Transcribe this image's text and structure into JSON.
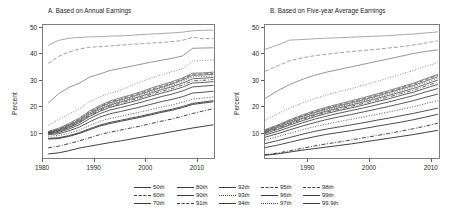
{
  "figure": {
    "panels": [
      {
        "id": "A",
        "title": "A. Based on Annual Earnings",
        "ylabel": "Percent",
        "yticks": [
          "10",
          "20",
          "30",
          "40",
          "50"
        ],
        "xticks": [
          "1980",
          "1990",
          "2000",
          "2010"
        ]
      },
      {
        "id": "B",
        "title": "B. Based on Five-year Average Earnings",
        "ylabel": "Percent",
        "yticks": [
          "10",
          "20",
          "30",
          "40",
          "50"
        ],
        "xticks": [
          "1990",
          "2000",
          "2010"
        ]
      }
    ],
    "legend": {
      "columns": [
        {
          "items": [
            {
              "label": "50th",
              "style": "solid"
            },
            {
              "label": "60th",
              "style": "dash"
            },
            {
              "label": "70th",
              "style": "solid"
            }
          ]
        },
        {
          "items": [
            {
              "label": "80th",
              "style": "solid"
            },
            {
              "label": "90th",
              "style": "solid"
            },
            {
              "label": "91th",
              "style": "dashdot"
            }
          ]
        },
        {
          "items": [
            {
              "label": "92th",
              "style": "solid"
            },
            {
              "label": "93th",
              "style": "dot"
            },
            {
              "label": "94th",
              "style": "solid"
            }
          ]
        },
        {
          "items": [
            {
              "label": "95th",
              "style": "dash"
            },
            {
              "label": "96th",
              "style": "solid"
            },
            {
              "label": "97th",
              "style": "dot"
            }
          ]
        },
        {
          "items": [
            {
              "label": "98th",
              "style": "dash"
            },
            {
              "label": "99th",
              "style": "solid"
            },
            {
              "label": "99.9th",
              "style": "solid"
            }
          ]
        }
      ]
    }
  },
  "chart_data": {
    "type": "line",
    "xlabel": "",
    "ylabel": "Percent",
    "ylim": [
      0,
      51
    ],
    "grid": false,
    "legend_position": "bottom",
    "panels": [
      {
        "id": "A",
        "title": "A. Based on Annual Earnings",
        "xlim": [
          1980,
          2013.5
        ],
        "x": [
          1981,
          1983,
          1985,
          1987,
          1989,
          1991,
          1993,
          1995,
          1997,
          1999,
          2001,
          2003,
          2005,
          2007,
          2009,
          2011,
          2013
        ],
        "series": [
          {
            "name": "99.9th",
            "style": "solid",
            "values": [
              43.3,
              45.2,
              46.0,
              46.3,
              46.5,
              46.6,
              46.8,
              46.9,
              47.1,
              47.4,
              47.6,
              47.8,
              48.0,
              48.3,
              48.8,
              49.0,
              49.1
            ]
          },
          {
            "name": "99th",
            "style": "dash",
            "values": [
              36.5,
              39.1,
              40.8,
              41.9,
              42.6,
              42.8,
              43.1,
              43.4,
              43.7,
              43.9,
              44.2,
              44.4,
              44.7,
              45.2,
              46.4,
              45.8,
              45.9
            ]
          },
          {
            "name": "98th",
            "style": "solid",
            "values": [
              21.5,
              25.0,
              27.4,
              29.0,
              31.3,
              32.5,
              33.8,
              34.6,
              35.4,
              36.2,
              37.0,
              37.7,
              38.4,
              39.3,
              42.2,
              42.3,
              42.4
            ]
          },
          {
            "name": "97th",
            "style": "dot",
            "values": [
              13.0,
              15.3,
              17.3,
              19.2,
              22.0,
              23.8,
              25.3,
              26.4,
              28.0,
              29.6,
              31.0,
              32.2,
              33.4,
              34.5,
              37.4,
              37.6,
              37.8
            ]
          },
          {
            "name": "96th",
            "style": "solid",
            "values": [
              10.8,
              12.0,
              13.8,
              15.8,
              18.5,
              20.6,
              22.3,
              23.5,
              24.6,
              25.8,
              27.2,
              28.4,
              29.6,
              31.0,
              32.8,
              32.9,
              33.2
            ]
          },
          {
            "name": "95th",
            "style": "dash",
            "values": [
              10.6,
              11.7,
              13.4,
              15.4,
              18.1,
              20.2,
              21.9,
              23.0,
              24.2,
              25.4,
              26.7,
              27.9,
              29.1,
              30.6,
              32.4,
              32.5,
              32.8
            ]
          },
          {
            "name": "94th",
            "style": "solid",
            "values": [
              10.5,
              11.5,
              13.2,
              15.1,
              17.8,
              19.9,
              21.6,
              22.7,
              23.8,
              25.0,
              26.3,
              27.5,
              28.7,
              30.2,
              32.0,
              32.1,
              32.4
            ]
          },
          {
            "name": "93th",
            "style": "dot",
            "values": [
              10.4,
              11.4,
              13.0,
              14.9,
              17.5,
              19.6,
              21.2,
              22.3,
              23.4,
              24.6,
              25.9,
              27.1,
              28.2,
              29.6,
              31.4,
              31.5,
              31.8
            ]
          },
          {
            "name": "92th",
            "style": "solid",
            "values": [
              10.3,
              11.2,
              12.8,
              14.6,
              17.2,
              19.2,
              20.8,
              21.9,
              23.0,
              24.1,
              25.4,
              26.6,
              27.7,
              29.0,
              30.7,
              30.9,
              31.2
            ]
          },
          {
            "name": "91th",
            "style": "dashdot",
            "values": [
              10.2,
              11.0,
              12.5,
              14.3,
              16.8,
              18.8,
              20.4,
              21.4,
              22.5,
              23.6,
              24.8,
              26.0,
              27.0,
              28.3,
              29.9,
              30.1,
              30.4
            ]
          },
          {
            "name": "90th",
            "style": "solid",
            "values": [
              10.1,
              10.8,
              12.2,
              14.0,
              16.4,
              18.4,
              19.9,
              20.9,
              21.9,
              23.0,
              24.2,
              25.3,
              26.3,
              27.5,
              29.1,
              29.3,
              29.6
            ]
          },
          {
            "name": "80th",
            "style": "solid",
            "values": [
              9.9,
              10.4,
              11.7,
              13.3,
              15.6,
              17.5,
              18.9,
              19.8,
              20.8,
              21.8,
              22.9,
              24.0,
              24.9,
              26.1,
              27.6,
              27.9,
              28.2
            ]
          },
          {
            "name": "70th",
            "style": "solid",
            "values": [
              9.6,
              9.9,
              11.0,
              12.4,
              14.4,
              16.2,
              17.5,
              18.3,
              19.2,
              20.1,
              21.1,
              22.1,
              22.9,
              23.9,
              25.3,
              25.6,
              26.0
            ]
          },
          {
            "name": "60th",
            "style": "dot",
            "values": [
              9.0,
              9.2,
              10.1,
              11.3,
              13.0,
              14.6,
              15.7,
              16.5,
              17.3,
              18.2,
              19.1,
              20.0,
              20.8,
              21.8,
              23.0,
              23.4,
              23.8
            ]
          },
          {
            "name": "50th",
            "style": "solid",
            "values": [
              8.2,
              8.4,
              9.2,
              10.3,
              11.8,
              13.2,
              14.2,
              15.0,
              15.8,
              16.6,
              17.5,
              18.4,
              19.2,
              20.2,
              21.4,
              21.9,
              22.4
            ]
          },
          {
            "name": "lower-A1",
            "style": "solid",
            "values": [
              7.9,
              8.1,
              8.9,
              10.0,
              11.4,
              12.8,
              13.8,
              14.6,
              15.4,
              16.2,
              17.1,
              18.0,
              18.8,
              19.8,
              21.0,
              21.5,
              22.0
            ]
          },
          {
            "name": "lower-A2",
            "style": "dashdot",
            "values": [
              4.6,
              5.2,
              6.2,
              7.2,
              8.4,
              9.6,
              10.5,
              11.3,
              12.1,
              12.9,
              13.8,
              14.7,
              15.5,
              16.5,
              17.6,
              18.5,
              19.4
            ]
          },
          {
            "name": "lower-A3",
            "style": "solid",
            "values": [
              2.3,
              2.7,
              3.5,
              4.5,
              5.2,
              5.9,
              6.6,
              7.2,
              7.9,
              8.6,
              9.3,
              10.0,
              10.7,
              11.4,
              12.1,
              12.7,
              13.3
            ]
          }
        ]
      },
      {
        "id": "B",
        "title": "B. Based on Five-year Average Earnings",
        "xlim": [
          1983,
          2011.5
        ],
        "x": [
          1983,
          1985,
          1987,
          1989,
          1991,
          1993,
          1995,
          1997,
          1999,
          2001,
          2003,
          2005,
          2007,
          2009,
          2011
        ],
        "series": [
          {
            "name": "99.9th",
            "style": "solid",
            "values": [
              41.8,
              43.4,
              45.3,
              45.5,
              45.8,
              46.0,
              46.2,
              46.4,
              46.6,
              46.8,
              47.0,
              47.3,
              47.6,
              48.0,
              48.4
            ]
          },
          {
            "name": "99th",
            "style": "dash",
            "values": [
              33.5,
              35.5,
              37.5,
              38.6,
              39.4,
              40.0,
              40.5,
              41.0,
              41.4,
              41.8,
              42.3,
              42.8,
              43.4,
              44.2,
              45.0
            ]
          },
          {
            "name": "98th",
            "style": "solid",
            "values": [
              23.2,
              26.1,
              28.5,
              30.4,
              32.0,
              33.2,
              34.2,
              35.2,
              36.2,
              37.2,
              38.2,
              39.2,
              40.2,
              41.0,
              41.6
            ]
          },
          {
            "name": "97th",
            "style": "dot",
            "values": [
              15.0,
              17.4,
              19.6,
              21.5,
              23.2,
              24.6,
              25.8,
              27.0,
              28.3,
              29.6,
              31.0,
              32.4,
              33.8,
              35.4,
              36.8
            ]
          },
          {
            "name": "96th",
            "style": "solid",
            "values": [
              11.4,
              13.2,
              15.2,
              17.0,
              18.6,
              20.0,
              21.2,
              22.4,
              23.6,
              24.9,
              26.2,
              27.6,
              29.0,
              30.7,
              32.4
            ]
          },
          {
            "name": "95th",
            "style": "dash",
            "values": [
              11.2,
              12.9,
              14.9,
              16.7,
              18.2,
              19.6,
              20.8,
              22.0,
              23.2,
              24.5,
              25.8,
              27.2,
              28.6,
              30.3,
              32.0
            ]
          },
          {
            "name": "94th",
            "style": "solid",
            "values": [
              11.0,
              12.7,
              14.6,
              16.4,
              17.9,
              19.3,
              20.5,
              21.6,
              22.8,
              24.1,
              25.4,
              26.8,
              28.1,
              29.8,
              31.5
            ]
          },
          {
            "name": "93th",
            "style": "dot",
            "values": [
              10.8,
              12.4,
              14.3,
              16.0,
              17.6,
              18.9,
              20.1,
              21.2,
              22.4,
              23.7,
              24.9,
              26.3,
              27.6,
              29.2,
              30.9
            ]
          },
          {
            "name": "92th",
            "style": "solid",
            "values": [
              10.6,
              12.2,
              14.0,
              15.7,
              17.2,
              18.5,
              19.7,
              20.8,
              22.0,
              23.2,
              24.4,
              25.7,
              27.0,
              28.6,
              30.2
            ]
          },
          {
            "name": "91th",
            "style": "dashdot",
            "values": [
              10.3,
              11.9,
              13.6,
              15.3,
              16.8,
              18.1,
              19.2,
              20.3,
              21.4,
              22.6,
              23.8,
              25.1,
              26.3,
              27.9,
              29.4
            ]
          },
          {
            "name": "90th",
            "style": "solid",
            "values": [
              10.0,
              11.5,
              13.2,
              14.8,
              16.3,
              17.6,
              18.7,
              19.7,
              20.8,
              22.0,
              23.1,
              24.4,
              25.6,
              27.1,
              28.6
            ]
          },
          {
            "name": "80th",
            "style": "solid",
            "values": [
              9.4,
              10.8,
              12.4,
              14.0,
              15.4,
              16.6,
              17.7,
              18.7,
              19.7,
              20.8,
              21.9,
              23.1,
              24.3,
              25.7,
              27.0
            ]
          },
          {
            "name": "70th",
            "style": "solid",
            "values": [
              8.6,
              9.9,
              11.4,
              12.8,
              14.1,
              15.3,
              16.3,
              17.2,
              18.2,
              19.2,
              20.2,
              21.3,
              22.4,
              23.7,
              24.9
            ]
          },
          {
            "name": "60th",
            "style": "dot",
            "values": [
              7.6,
              8.8,
              10.1,
              11.4,
              12.6,
              13.6,
              14.5,
              15.4,
              16.3,
              17.2,
              18.1,
              19.1,
              20.1,
              21.3,
              22.4
            ]
          },
          {
            "name": "50th",
            "style": "solid",
            "values": [
              6.2,
              7.3,
              8.5,
              9.7,
              10.8,
              11.7,
              12.5,
              13.3,
              14.1,
              15.0,
              15.8,
              16.7,
              17.6,
              18.6,
              19.6
            ]
          },
          {
            "name": "lower-B1",
            "style": "solid",
            "values": [
              4.7,
              5.6,
              6.7,
              7.8,
              8.8,
              9.7,
              10.4,
              11.1,
              11.9,
              12.7,
              13.5,
              14.3,
              15.2,
              16.2,
              17.3
            ]
          },
          {
            "name": "lower-B2",
            "style": "dashdot",
            "values": [
              2.0,
              2.6,
              3.5,
              4.4,
              5.3,
              6.1,
              6.8,
              7.6,
              8.4,
              9.2,
              10.0,
              10.9,
              11.8,
              12.8,
              13.9
            ]
          },
          {
            "name": "lower-B3",
            "style": "solid",
            "values": [
              1.8,
              2.3,
              3.0,
              3.7,
              4.3,
              4.9,
              5.5,
              6.1,
              6.8,
              7.5,
              8.2,
              8.9,
              9.6,
              10.4,
              11.2
            ]
          }
        ]
      }
    ]
  }
}
